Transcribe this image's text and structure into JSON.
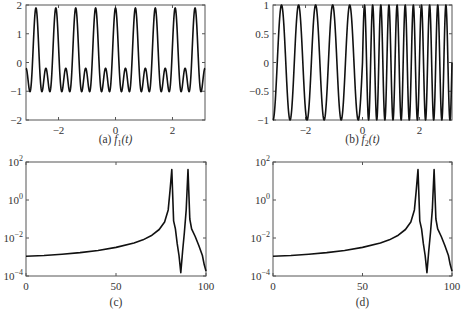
{
  "chart_data": [
    {
      "id": "a",
      "type": "line",
      "caption": "(a) f1(t)",
      "caption_prefix": "(a)",
      "caption_func": "f",
      "caption_sub": "1",
      "caption_arg": "(t)",
      "xlim": [
        -3.1416,
        3.1416
      ],
      "ylim": [
        -2,
        2
      ],
      "xticks": [
        -2,
        0,
        2
      ],
      "yticks": [
        -2,
        -1,
        0,
        1,
        2
      ],
      "xtick_labels": [
        "−2",
        "0",
        "2"
      ],
      "ytick_labels": [
        "−2",
        "−1",
        "0",
        "1",
        "2"
      ],
      "description": "Periodic signal, sum of two sinusoids; peaks ~1.9, troughs ~-1.7, secondary bumps ~0.35 / -0.4",
      "formula": "sin(10t)+cos(20t)-ish: peaks near 1.9, 9 major peaks over [-pi,pi]"
    },
    {
      "id": "b",
      "type": "line",
      "caption": "(b) f2(t)",
      "caption_prefix": "(b)",
      "caption_func": "f",
      "caption_sub": "2",
      "caption_arg": "(t)",
      "xlim": [
        -3.1416,
        3.1416
      ],
      "ylim": [
        -1,
        1
      ],
      "xticks": [
        -2,
        0,
        2
      ],
      "yticks": [
        -1,
        -0.5,
        0,
        0.5,
        1
      ],
      "xtick_labels": [
        "−2",
        "0",
        "2"
      ],
      "ytick_labels": [
        "−1",
        "−0.5",
        "0",
        "0.5",
        "1"
      ],
      "description": "Piecewise sinusoid: lower frequency for t<0 (~5 cycles), higher frequency for t>0 (~11 cycles), amplitude 1"
    },
    {
      "id": "c",
      "type": "line",
      "caption": "(c)",
      "yscale": "log",
      "xlim": [
        0,
        100
      ],
      "ylim": [
        0.0001,
        100
      ],
      "xticks": [
        0,
        50,
        100
      ],
      "yticks": [
        0.0001,
        0.01,
        1,
        100
      ],
      "xtick_labels": [
        "0",
        "50",
        "100"
      ],
      "ytick_labels": [
        "10",
        "10",
        "10",
        "10"
      ],
      "ytick_exponents": [
        "−4",
        "−2",
        "0",
        "2"
      ],
      "points": [
        [
          0,
          0.0011
        ],
        [
          10,
          0.0012
        ],
        [
          20,
          0.0014
        ],
        [
          30,
          0.0017
        ],
        [
          40,
          0.0022
        ],
        [
          50,
          0.0032
        ],
        [
          60,
          0.0055
        ],
        [
          65,
          0.008
        ],
        [
          70,
          0.014
        ],
        [
          74,
          0.028
        ],
        [
          77,
          0.07
        ],
        [
          79,
          0.3
        ],
        [
          80,
          3
        ],
        [
          81,
          40
        ],
        [
          82,
          0.08
        ],
        [
          83,
          0.03
        ],
        [
          84,
          0.005
        ],
        [
          85,
          0.0012
        ],
        [
          86,
          0.00015
        ],
        [
          87,
          0.002
        ],
        [
          88,
          0.02
        ],
        [
          89,
          0.3
        ],
        [
          90,
          40
        ],
        [
          91,
          0.1
        ],
        [
          92,
          0.03
        ],
        [
          94,
          0.012
        ],
        [
          96,
          0.004
        ],
        [
          98,
          0.0012
        ],
        [
          99,
          0.0004
        ],
        [
          100,
          0.00018
        ]
      ]
    },
    {
      "id": "d",
      "type": "line",
      "caption": "(d)",
      "yscale": "log",
      "xlim": [
        0,
        100
      ],
      "ylim": [
        0.0001,
        100
      ],
      "xticks": [
        0,
        50,
        100
      ],
      "yticks": [
        0.0001,
        0.01,
        1,
        100
      ],
      "xtick_labels": [
        "0",
        "50",
        "100"
      ],
      "ytick_labels": [
        "10",
        "10",
        "10",
        "10"
      ],
      "ytick_exponents": [
        "−4",
        "−2",
        "0",
        "2"
      ],
      "points": [
        [
          0,
          0.0011
        ],
        [
          10,
          0.0012
        ],
        [
          20,
          0.0014
        ],
        [
          30,
          0.0017
        ],
        [
          40,
          0.0022
        ],
        [
          50,
          0.0032
        ],
        [
          60,
          0.0055
        ],
        [
          65,
          0.008
        ],
        [
          70,
          0.014
        ],
        [
          74,
          0.028
        ],
        [
          77,
          0.07
        ],
        [
          79,
          0.3
        ],
        [
          80,
          3
        ],
        [
          81,
          40
        ],
        [
          82,
          0.08
        ],
        [
          83,
          0.03
        ],
        [
          84,
          0.005
        ],
        [
          85,
          0.0012
        ],
        [
          86,
          0.00015
        ],
        [
          87,
          0.002
        ],
        [
          88,
          0.02
        ],
        [
          89,
          0.3
        ],
        [
          90,
          40
        ],
        [
          91,
          0.1
        ],
        [
          92,
          0.03
        ],
        [
          94,
          0.012
        ],
        [
          96,
          0.004
        ],
        [
          98,
          0.0012
        ],
        [
          99,
          0.0004
        ],
        [
          100,
          0.00018
        ]
      ]
    }
  ],
  "layout": {
    "line_color": "#111111",
    "axis_color": "#555555",
    "panels": {
      "a": {
        "x0": 26,
        "y0": 5,
        "x1": 205,
        "y1": 120,
        "cap_y": 143
      },
      "b": {
        "x0": 273,
        "y0": 5,
        "x1": 452,
        "y1": 120,
        "cap_y": 143
      },
      "c": {
        "x0": 26,
        "y0": 162,
        "x1": 206,
        "y1": 276,
        "cap_y": 306
      },
      "d": {
        "x0": 273,
        "y0": 162,
        "x1": 452,
        "y1": 276,
        "cap_y": 306
      }
    }
  }
}
